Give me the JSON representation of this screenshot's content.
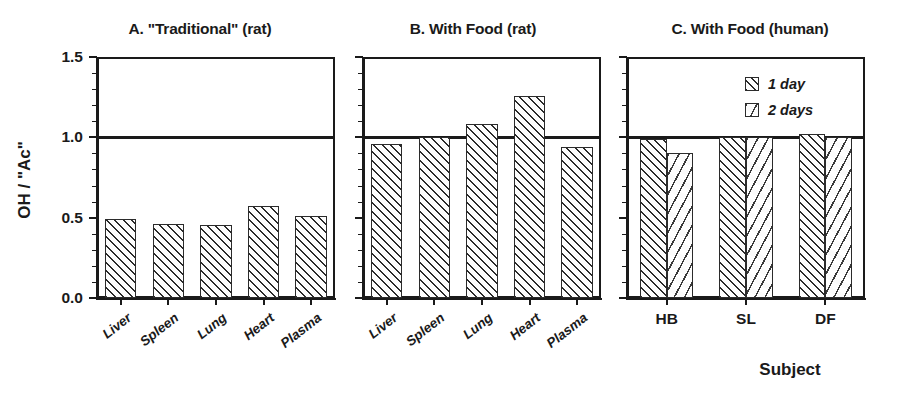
{
  "figure": {
    "ylabel": "OH / \"Ac\"",
    "xlabel_right": "Subject",
    "y_ticks": [
      "0.0",
      "0.5",
      "1.0",
      "1.5"
    ],
    "reference_line_value": 1.0,
    "ylim": [
      0.0,
      1.5
    ]
  },
  "legend": {
    "items": [
      {
        "label": "1 day",
        "pattern": "dense-diagonal-hatch"
      },
      {
        "label": "2 days",
        "pattern": "sparse-dash-hatch"
      }
    ]
  },
  "chart_data": [
    {
      "type": "bar",
      "title": "A. \"Traditional\" (rat)",
      "panel": "A",
      "categories": [
        "Liver",
        "Spleen",
        "Lung",
        "Heart",
        "Plasma"
      ],
      "values": [
        0.49,
        0.46,
        0.455,
        0.575,
        0.51
      ],
      "series": [
        {
          "name": "OH / \"Ac\"",
          "values": [
            0.49,
            0.46,
            0.455,
            0.575,
            0.51
          ]
        }
      ],
      "xlabel": "",
      "ylabel": "OH / \"Ac\"",
      "ylim": [
        0.0,
        1.5
      ],
      "yticks": [
        0.0,
        0.5,
        1.0,
        1.5
      ],
      "reference_line": 1.0,
      "grid": false,
      "legend": "none"
    },
    {
      "type": "bar",
      "title": "B. With Food (rat)",
      "panel": "B",
      "categories": [
        "Liver",
        "Spleen",
        "Lung",
        "Heart",
        "Plasma"
      ],
      "values": [
        0.96,
        1.0,
        1.08,
        1.26,
        0.94
      ],
      "series": [
        {
          "name": "OH / \"Ac\"",
          "values": [
            0.96,
            1.0,
            1.08,
            1.26,
            0.94
          ]
        }
      ],
      "xlabel": "",
      "ylabel": "",
      "ylim": [
        0.0,
        1.5
      ],
      "yticks": [
        0.0,
        0.5,
        1.0,
        1.5
      ],
      "reference_line": 1.0,
      "grid": false,
      "legend": "none"
    },
    {
      "type": "bar",
      "title": "C. With Food (human)",
      "panel": "C",
      "categories": [
        "HB",
        "SL",
        "DF"
      ],
      "series": [
        {
          "name": "1 day",
          "values": [
            0.99,
            1.0,
            1.02
          ]
        },
        {
          "name": "2 days",
          "values": [
            0.9,
            1.0,
            1.0
          ]
        }
      ],
      "xlabel": "Subject",
      "ylabel": "",
      "ylim": [
        0.0,
        1.5
      ],
      "yticks": [
        0.0,
        0.5,
        1.0,
        1.5
      ],
      "reference_line": 1.0,
      "grid": false,
      "legend": "upper-right"
    }
  ]
}
